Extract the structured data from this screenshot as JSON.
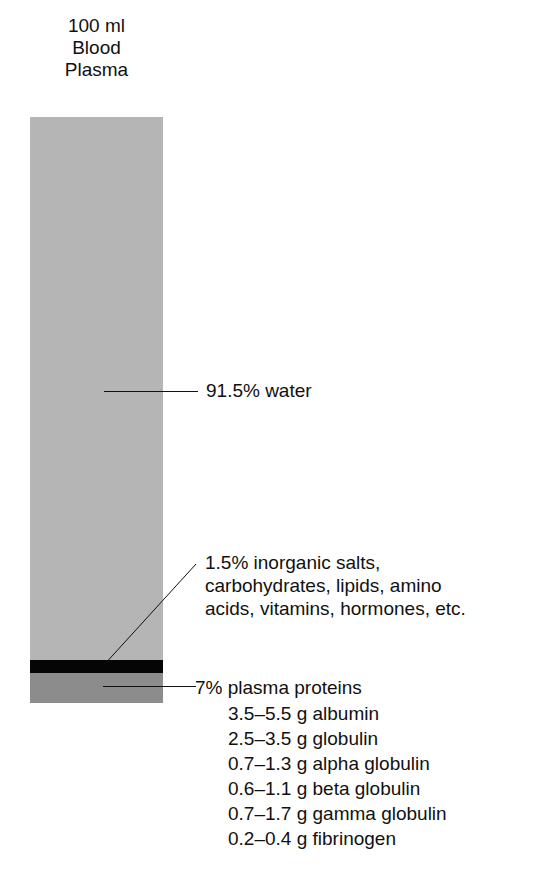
{
  "title": {
    "line1": "100 ml",
    "line2": "Blood",
    "line3": "Plasma"
  },
  "colors": {
    "water": "#b5b5b5",
    "salts": "#050505",
    "proteins": "#8c8c8c"
  },
  "labels": {
    "water": "91.5% water",
    "salts": [
      "1.5% inorganic salts,",
      "carbohydrates, lipids, amino",
      "acids, vitamins, hormones, etc."
    ],
    "proteins": "7% plasma proteins",
    "protein_items": [
      "3.5–5.5 g albumin",
      "2.5–3.5 g globulin",
      "0.7–1.3 g alpha globulin",
      "0.6–1.1 g beta globulin",
      "0.7–1.7 g gamma globulin",
      "0.2–0.4 g fibrinogen"
    ]
  }
}
